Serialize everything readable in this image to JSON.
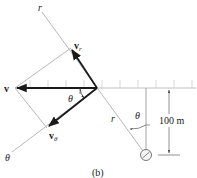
{
  "figure": {
    "caption": "(b)",
    "labels": {
      "r_axis_top": "r",
      "r_line": "r",
      "theta_axis": "θ",
      "theta_angle_origin": "θ",
      "theta_angle_vertical": "θ",
      "v": "v",
      "v_r_main": "v",
      "v_r_sub": "r",
      "v_theta_main": "v",
      "v_theta_sub": "θ",
      "height_dimension": "100 m"
    },
    "colors": {
      "vector": "#1a1a1a",
      "construction_line": "#b8b8b8",
      "ground_hatch": "#c8c8c8",
      "text": "#222222"
    }
  }
}
